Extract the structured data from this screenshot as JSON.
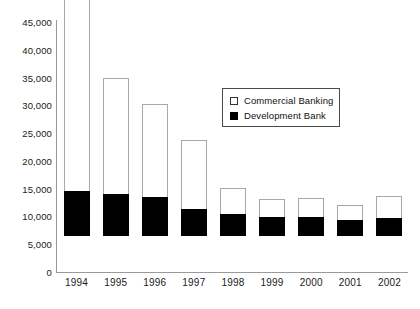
{
  "chart_data": {
    "type": "bar",
    "subtype": "stacked-vertical",
    "title": "",
    "subtitle": "",
    "xlabel": "",
    "ylabel": "",
    "categories": [
      "1994",
      "1995",
      "1996",
      "1997",
      "1998",
      "1999",
      "2000",
      "2001",
      "2002"
    ],
    "series": [
      {
        "name": "Commercial Banking",
        "color": "#ffffff",
        "border_color": "#a8a8a8",
        "values": [
          35200,
          20900,
          16800,
          12400,
          4600,
          3200,
          3400,
          2700,
          3900
        ]
      },
      {
        "name": "Development Bank",
        "color": "#000000",
        "border_color": "#000000",
        "values": [
          8100,
          7600,
          7000,
          4900,
          4000,
          3500,
          3500,
          2900,
          3300
        ]
      }
    ],
    "totals": [
      43300,
      28500,
      23800,
      17300,
      8600,
      6700,
      6900,
      5600,
      7200
    ],
    "ylim": [
      0,
      45000
    ],
    "yticks": [
      0,
      5000,
      10000,
      15000,
      20000,
      25000,
      30000,
      35000,
      40000,
      45000
    ],
    "ytick_labels": [
      "0",
      "5,000",
      "10,000",
      "15,000",
      "20,000",
      "25,000",
      "30,000",
      "35,000",
      "40,000",
      "45,000"
    ],
    "grid": false,
    "legend_position": "upper-right-inside",
    "legend_entries": [
      "Commercial Banking",
      "Development Bank"
    ],
    "annotations": []
  }
}
